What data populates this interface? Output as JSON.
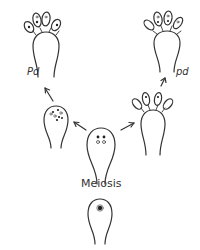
{
  "diagram": {
    "type": "biological developmental sequence",
    "labels": {
      "pd_left": "Pd",
      "pd_right": "pd",
      "meiosis": "Meiosis"
    },
    "stages": [
      {
        "id": "basidium-diploid",
        "description": "young basidium with single diploid nucleus",
        "position": "bottom-center"
      },
      {
        "id": "basidium-post-meiosis",
        "description": "basidium with four haploid nuclei after meiosis",
        "position": "center"
      },
      {
        "id": "basidium-left-nuclei",
        "description": "basidium with multiple nuclei clustered at apex",
        "position": "middle-left"
      },
      {
        "id": "basidium-left-spores",
        "description": "mature basidium bearing four spores (Pd)",
        "position": "top-left"
      },
      {
        "id": "basidium-right-spores-young",
        "description": "basidium with four developing spores",
        "position": "middle-right"
      },
      {
        "id": "basidium-right-spores",
        "description": "mature basidium bearing four spores (pd)",
        "position": "top-right"
      }
    ],
    "arrows": [
      {
        "from": "basidium-diploid",
        "to": "basidium-post-meiosis"
      },
      {
        "from": "basidium-post-meiosis",
        "to": "basidium-left-nuclei"
      },
      {
        "from": "basidium-post-meiosis",
        "to": "basidium-right-spores-young"
      },
      {
        "from": "basidium-left-nuclei",
        "to": "basidium-left-spores"
      },
      {
        "from": "basidium-right-spores-young",
        "to": "basidium-right-spores"
      }
    ],
    "colors": {
      "line": "#333333",
      "background": "#ffffff"
    }
  }
}
